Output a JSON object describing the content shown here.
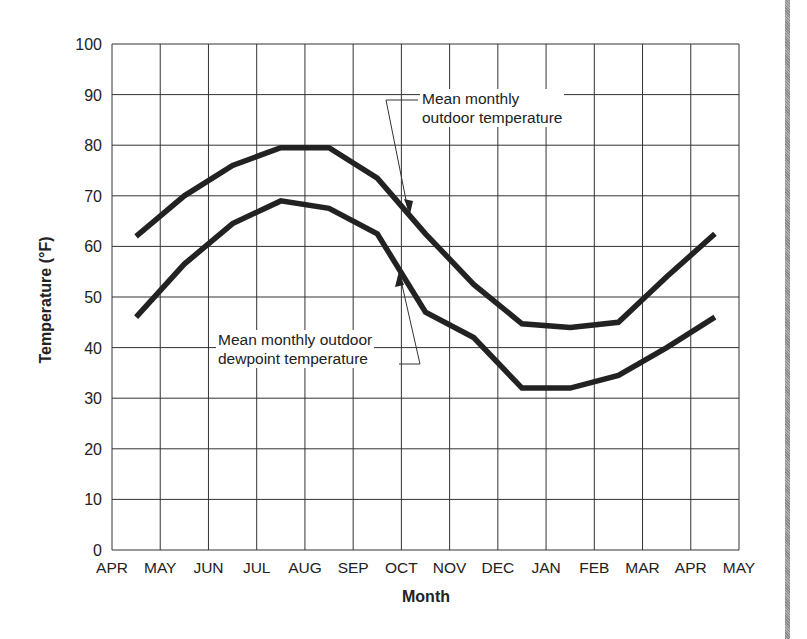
{
  "chart_data": {
    "type": "line",
    "title": "",
    "xlabel": "Month",
    "ylabel": "Temperature (°F)",
    "ylim": [
      0,
      100
    ],
    "yticks": [
      0,
      10,
      20,
      30,
      40,
      50,
      60,
      70,
      80,
      90,
      100
    ],
    "xticks": [
      "APR",
      "MAY",
      "JUN",
      "JUL",
      "AUG",
      "SEP",
      "OCT",
      "NOV",
      "DEC",
      "JAN",
      "FEB",
      "MAR",
      "APR",
      "MAY"
    ],
    "grid": true,
    "categories": [
      "APR",
      "MAY",
      "JUN",
      "JUL",
      "AUG",
      "SEP",
      "OCT",
      "NOV",
      "DEC",
      "JAN",
      "FEB",
      "MAR",
      "APR"
    ],
    "series": [
      {
        "name": "Mean monthly outdoor temperature",
        "values": [
          62,
          70,
          76,
          79.5,
          79.5,
          73.5,
          62.5,
          52.5,
          44.7,
          44,
          45,
          54,
          62.5
        ]
      },
      {
        "name": "Mean monthly outdoor dewpoint temperature",
        "values": [
          46,
          56.5,
          64.5,
          69,
          67.5,
          62.5,
          47,
          42,
          32,
          32,
          34.5,
          40,
          46
        ]
      }
    ],
    "annotations": [
      {
        "text_line1": "Mean monthly",
        "text_line2": "outdoor temperature",
        "points_to": "Mean monthly outdoor temperature"
      },
      {
        "text_line1": "Mean monthly outdoor",
        "text_line2": "dewpoint temperature",
        "points_to": "Mean monthly outdoor dewpoint temperature"
      }
    ]
  },
  "labels": {
    "upper_line1": "Mean monthly",
    "upper_line2": "outdoor temperature",
    "lower_line1": "Mean monthly outdoor",
    "lower_line2": "dewpoint temperature",
    "x_title": "Month",
    "y_title": "Temperature (°F)"
  },
  "style": {
    "line_color": "#222222",
    "grid_color": "#333333"
  }
}
